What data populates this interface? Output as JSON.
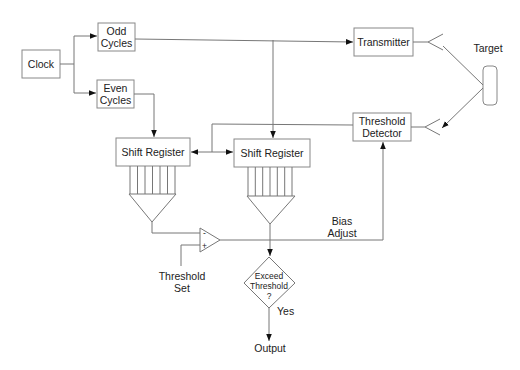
{
  "diagram": {
    "clock": "Clock",
    "odd_cycles": [
      "Odd",
      "Cycles"
    ],
    "even_cycles": [
      "Even",
      "Cycles"
    ],
    "transmitter": "Transmitter",
    "target": "Target",
    "threshold_detector": [
      "Threshold",
      "Detector"
    ],
    "shift_register_1": "Shift Register",
    "shift_register_2": "Shift Register",
    "comparator_minus": "-",
    "comparator_plus": "+",
    "threshold_set": [
      "Threshold",
      "Set"
    ],
    "bias_adjust": [
      "Bias",
      "Adjust"
    ],
    "decision": [
      "Exceed",
      "Threshold",
      "?"
    ],
    "yes": "Yes",
    "output": "Output"
  }
}
